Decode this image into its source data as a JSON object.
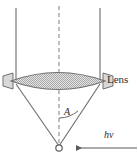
{
  "figure": {
    "type": "optics-ray-diagram",
    "background_color": "#ffffff",
    "stroke_color": "#4a4a4a",
    "lens_fill_color": "#c9c9c9",
    "lens_edge_color": "#7a7a7a",
    "text_color": "#2b2b2b"
  },
  "labels": {
    "lens": "Lens",
    "angle": "A",
    "photon": "hν"
  },
  "icons": {
    "focal_point": "open-circle-marker",
    "photon_arrow": "left-arrow"
  },
  "geometry": {
    "canvas": {
      "width": 138,
      "height": 164
    },
    "optical_axis": {
      "x": 59,
      "y_top": 6,
      "y_bottom": 146,
      "style": "dashed"
    },
    "incoming_rays": [
      {
        "x": 16,
        "y_top": 8,
        "y_bottom": 80
      },
      {
        "x": 100,
        "y_top": 8,
        "y_bottom": 80
      }
    ],
    "lens": {
      "center_x": 58,
      "center_y": 81,
      "half_width": 47,
      "half_height": 13,
      "fill": "stipple"
    },
    "converging_rays": [
      {
        "x1": 16,
        "y1": 82,
        "x2": 59,
        "y2": 146
      },
      {
        "x1": 100,
        "y1": 82,
        "x2": 59,
        "y2": 146
      }
    ],
    "focal_point": {
      "x": 59,
      "y": 148,
      "radius": 3.2
    },
    "angle_arc": {
      "vertex_x": 59,
      "vertex_y": 148,
      "radius": 30,
      "label_x": 66,
      "label_y": 112
    },
    "photon_arrow": {
      "x_tail": 137,
      "x_head": 74,
      "y": 148,
      "direction": "left"
    }
  }
}
